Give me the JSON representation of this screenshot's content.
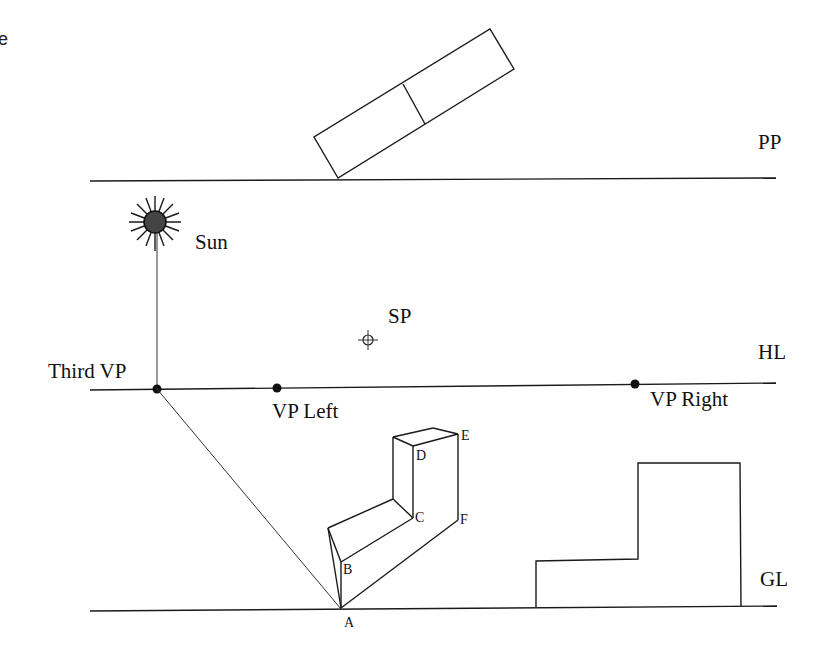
{
  "diagram": {
    "corner_fragment": "e",
    "lines": {
      "picture_plane": {
        "label": "PP"
      },
      "horizon_line": {
        "label": "HL"
      },
      "ground_line": {
        "label": "GL"
      }
    },
    "points": {
      "sun": {
        "label": "Sun"
      },
      "station_point": {
        "label": "SP"
      },
      "third_vp": {
        "label": "Third VP"
      },
      "vp_left": {
        "label": "VP Left"
      },
      "vp_right": {
        "label": "VP Right"
      }
    },
    "object_vertices": [
      "A",
      "B",
      "C",
      "D",
      "E",
      "F"
    ],
    "colors": {
      "line": "#1a1a1a",
      "sun_fill": "#444444",
      "background": "#ffffff"
    }
  }
}
